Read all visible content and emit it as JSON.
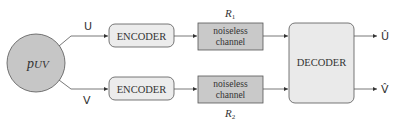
{
  "diagram": {
    "type": "block-diagram",
    "colors": {
      "source_fill": "#c6c6c6",
      "encoder_fill": "#ececec",
      "channel_fill": "#c9c9c9",
      "decoder_fill": "#eaeaea",
      "stroke": "#555555",
      "text": "#333333"
    },
    "source": {
      "label": "p",
      "subscript": "UV"
    },
    "inputs": [
      {
        "label": "U"
      },
      {
        "label": "V"
      }
    ],
    "encoders": [
      {
        "label": "ENCODER"
      },
      {
        "label": "ENCODER"
      }
    ],
    "channels": [
      {
        "line1": "noiseless",
        "line2": "channel",
        "rate_symbol": "R",
        "rate_subscript": "1"
      },
      {
        "line1": "noiseless",
        "line2": "channel",
        "rate_symbol": "R",
        "rate_subscript": "2"
      }
    ],
    "decoder": {
      "label": "DECODER"
    },
    "outputs": [
      {
        "label": "Û"
      },
      {
        "label": "V̂"
      }
    ]
  }
}
